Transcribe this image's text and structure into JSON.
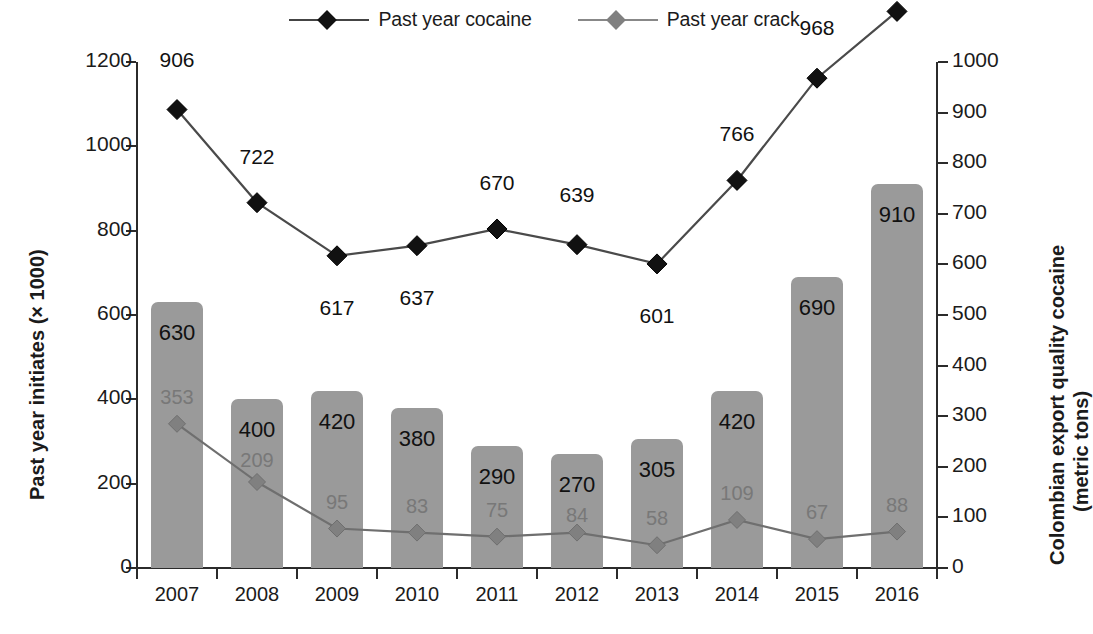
{
  "legend": {
    "items": [
      {
        "label": "Past year cocaine",
        "color": "#111111",
        "marker": "diamond"
      },
      {
        "label": "Past year crack",
        "color": "#808080",
        "marker": "diamond"
      }
    ]
  },
  "axes": {
    "left_title": "Past year initiates (× 1000)",
    "right_title_line1": "Colombian export quality cocaine",
    "right_title_line2": "(metric tons)",
    "left_ticks": [
      "0",
      "200",
      "400",
      "600",
      "800",
      "1000",
      "1200"
    ],
    "right_ticks": [
      "0",
      "100",
      "200",
      "300",
      "400",
      "500",
      "600",
      "700",
      "800",
      "900",
      "1000"
    ],
    "x_ticks": [
      "2007",
      "2008",
      "2009",
      "2010",
      "2011",
      "2012",
      "2013",
      "2014",
      "2015",
      "2016"
    ]
  },
  "chart_data": {
    "type": "bar",
    "title": "",
    "categories": [
      "2007",
      "2008",
      "2009",
      "2010",
      "2011",
      "2012",
      "2013",
      "2014",
      "2015",
      "2016"
    ],
    "xlabel": "",
    "ylabel": "Past year initiates (× 1000)",
    "y2label": "Colombian export quality cocaine (metric tons)",
    "ylim": [
      0,
      1200
    ],
    "y2lim": [
      0,
      1000
    ],
    "grid": false,
    "legend_position": "top-center",
    "series": [
      {
        "name": "Past year cocaine initiates",
        "type": "bar",
        "axis": "left",
        "color": "#9a9a9a",
        "label_color": "#111111",
        "values": [
          630,
          400,
          420,
          380,
          290,
          270,
          305,
          420,
          690,
          910
        ],
        "labels": [
          "630",
          "400",
          "420",
          "380",
          "290",
          "270",
          "305",
          "420",
          "690",
          "910"
        ]
      },
      {
        "name": "Past year crack initiates",
        "type": "bar-label-only",
        "axis": "left",
        "color": "#9a9a9a",
        "label_color": "#787878",
        "values": [
          353,
          209,
          95,
          83,
          75,
          84,
          58,
          109,
          67,
          88
        ],
        "labels": [
          "353",
          "209",
          "95",
          "83",
          "75",
          "84",
          "58",
          "109",
          "67",
          "88"
        ]
      },
      {
        "name": "Past year cocaine",
        "type": "line",
        "axis": "right",
        "color": "#111111",
        "marker": "diamond",
        "values": [
          906,
          722,
          617,
          637,
          670,
          639,
          601,
          766,
          968,
          1100
        ],
        "labels": [
          "906",
          "722",
          "617",
          "637",
          "670",
          "639",
          "601",
          "766",
          "968",
          "1100"
        ]
      },
      {
        "name": "Past year crack",
        "type": "line",
        "axis": "right",
        "color": "#808080",
        "marker": "diamond",
        "values": [
          285,
          170,
          78,
          70,
          62,
          70,
          45,
          95,
          57,
          72
        ],
        "labels": []
      }
    ]
  }
}
